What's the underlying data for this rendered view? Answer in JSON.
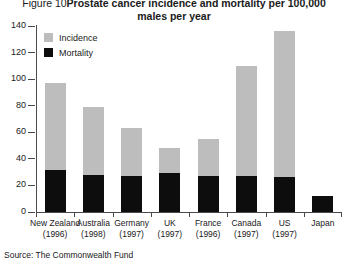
{
  "figure": {
    "number_label": "Figure 10",
    "title_line1": "Prostate cancer incidence and mortality per 100,000",
    "title_line2": "males per year",
    "source": "Source: The Commonwealth Fund"
  },
  "legend": {
    "items": [
      {
        "label": "Incidence",
        "color": "#bdbdbd",
        "swatch": "incidence"
      },
      {
        "label": "Mortality",
        "color": "#0d0d0d",
        "swatch": "mortality"
      }
    ]
  },
  "axis": {
    "y_ticks": [
      "0",
      "20",
      "40",
      "60",
      "80",
      "100",
      "120",
      "140"
    ]
  },
  "chart_data": {
    "type": "bar",
    "subtype": "stacked",
    "xlabel": "",
    "ylabel": "",
    "ylim": [
      0,
      140
    ],
    "ytick_step": 20,
    "grid": false,
    "legend_position": "top-left",
    "categories": [
      "New Zealand",
      "Australia",
      "Germany",
      "UK",
      "France",
      "Canada",
      "US",
      "Japan"
    ],
    "category_years": [
      "(1996)",
      "(1998)",
      "(1997)",
      "(1997)",
      "(1996)",
      "(1997)",
      "(1997)",
      ""
    ],
    "series": [
      {
        "name": "Incidence",
        "color": "#bdbdbd",
        "values": [
          97,
          79,
          63,
          48,
          55,
          110,
          136,
          12
        ]
      },
      {
        "name": "Mortality",
        "color": "#0d0d0d",
        "values": [
          32,
          28,
          27,
          29,
          27,
          27,
          26,
          12
        ]
      }
    ],
    "note": "Incidence values are total bar heights; the black mortality segment is drawn over the lower part of each incidence bar. Japan shows only a short solid bar of about 12."
  }
}
